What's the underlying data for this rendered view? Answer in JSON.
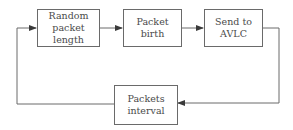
{
  "diagram": {
    "type": "flowchart-loop",
    "nodes": [
      {
        "id": "random-packet-length",
        "label": "Random\npacket length"
      },
      {
        "id": "packet-birth",
        "label": "Packet\nbirth"
      },
      {
        "id": "send-to-avlc",
        "label": "Send to\nAVLC"
      },
      {
        "id": "packets-interval",
        "label": "Packets\ninterval"
      }
    ],
    "edges": [
      {
        "from": "random-packet-length",
        "to": "packet-birth"
      },
      {
        "from": "packet-birth",
        "to": "send-to-avlc"
      },
      {
        "from": "send-to-avlc",
        "to": "packets-interval"
      },
      {
        "from": "packets-interval",
        "to": "random-packet-length"
      }
    ],
    "colors": {
      "line": "#6a6a6a",
      "text": "#4a4a4a",
      "background": "#ffffff"
    }
  }
}
